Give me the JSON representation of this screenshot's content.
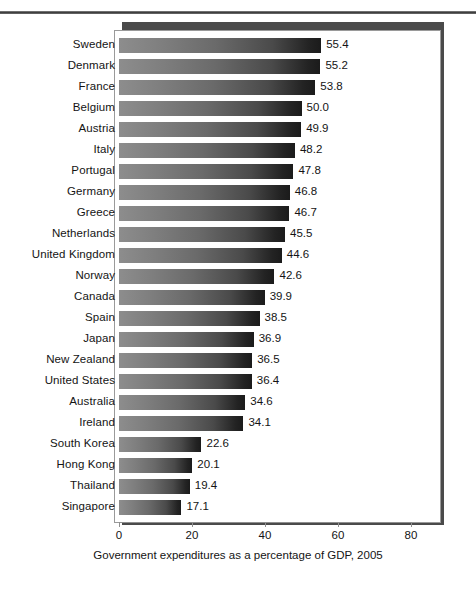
{
  "chart_data": {
    "type": "bar",
    "orientation": "horizontal",
    "title": "",
    "xlabel": "Government expenditures as a percentage of GDP, 2005",
    "ylabel": "",
    "xlim": [
      0,
      80
    ],
    "xticks": [
      0,
      20,
      40,
      60,
      80
    ],
    "xtick_labels": [
      "0",
      "20",
      "40",
      "60",
      "80"
    ],
    "grid": false,
    "legend": null,
    "value_label_format": "one-decimal",
    "categories": [
      "Sweden",
      "Denmark",
      "France",
      "Belgium",
      "Austria",
      "Italy",
      "Portugal",
      "Germany",
      "Greece",
      "Netherlands",
      "United Kingdom",
      "Norway",
      "Canada",
      "Spain",
      "Japan",
      "New Zealand",
      "United States",
      "Australia",
      "Ireland",
      "South Korea",
      "Hong Kong",
      "Thailand",
      "Singapore"
    ],
    "values": [
      55.4,
      55.2,
      53.8,
      50.0,
      49.9,
      48.2,
      47.8,
      46.8,
      46.7,
      45.5,
      44.6,
      42.6,
      39.9,
      38.5,
      36.9,
      36.5,
      36.4,
      34.6,
      34.1,
      22.6,
      20.1,
      19.4,
      17.1
    ],
    "value_labels": [
      "55.4",
      "55.2",
      "53.8",
      "50.0",
      "49.9",
      "48.2",
      "47.8",
      "46.8",
      "46.7",
      "45.5",
      "44.6",
      "42.6",
      "39.9",
      "38.5",
      "36.9",
      "36.5",
      "36.4",
      "34.6",
      "34.1",
      "22.6",
      "20.1",
      "19.4",
      "17.1"
    ],
    "bar_gradient": {
      "from": "#8d8d8d",
      "to": "#1b1b1b",
      "direction": "left-to-right"
    },
    "colors": {
      "panel_background": "#ffffff",
      "panel_border": "#9a9a9a",
      "panel_shadow": "#4a4a4a",
      "axis": "#8f8f8f",
      "text": "#141414",
      "rule": "#3a3a3a"
    }
  }
}
